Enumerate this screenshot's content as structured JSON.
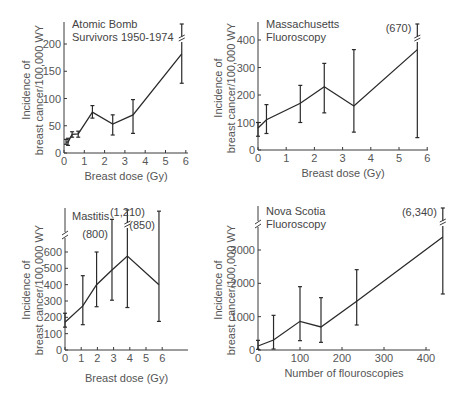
{
  "chart_data": [
    {
      "id": "atomic",
      "type": "line",
      "title": "Atomic Bomb Survivors 1950-1974",
      "title_lines": [
        "Atomic Bomb",
        "Survivors 1950-1974"
      ],
      "xlabel": "Breast dose (Gy)",
      "ylabel_lines": [
        "Incidence of",
        "breast cancer/100,000 WY"
      ],
      "xlim": [
        0,
        6
      ],
      "ylim": [
        0,
        240
      ],
      "xticks": [
        0,
        1,
        2,
        3,
        4,
        5,
        6
      ],
      "yticks": [
        0,
        50,
        100,
        150,
        200
      ],
      "x": [
        0.1,
        0.2,
        0.4,
        0.7,
        1.4,
        2.4,
        3.4,
        5.8
      ],
      "y": [
        20,
        20,
        34,
        35,
        75,
        53,
        70,
        182
      ],
      "err_low": [
        16,
        14,
        29,
        29,
        64,
        33,
        36,
        128
      ],
      "err_high": [
        25,
        27,
        39,
        40,
        87,
        70,
        98,
        238
      ],
      "grid": false,
      "legend": null
    },
    {
      "id": "massachusetts",
      "type": "line",
      "title": "Massachusetts Fluoroscopy",
      "title_lines": [
        "Massachusetts",
        "Fluoroscopy"
      ],
      "xlabel": "Breast dose (Gy)",
      "ylabel_lines": [
        "Incidence of",
        "breast cancer/100,000 WY"
      ],
      "xlim": [
        0,
        6
      ],
      "ylim": [
        0,
        450
      ],
      "xticks": [
        0,
        1,
        2,
        3,
        4,
        5,
        6
      ],
      "yticks": [
        0,
        100,
        200,
        300,
        400
      ],
      "x": [
        0,
        0.3,
        1.5,
        2.35,
        3.4,
        5.65
      ],
      "y": [
        80,
        110,
        170,
        230,
        160,
        365
      ],
      "err_low": [
        50,
        60,
        100,
        135,
        65,
        45
      ],
      "err_high": [
        100,
        165,
        235,
        315,
        365,
        670
      ],
      "annotations": [
        {
          "text": "(670)",
          "x": 5.65,
          "note": "upper error bar truncated with axis break"
        }
      ],
      "grid": false,
      "legend": null
    },
    {
      "id": "mastitis",
      "type": "line",
      "title": "Mastitis",
      "title_lines": [
        "Mastitis"
      ],
      "xlabel": "Breast dose (Gy)",
      "ylabel_lines": [
        "Incidence of",
        "breast cancer/100,000 WY"
      ],
      "xlim": [
        0,
        7.5
      ],
      "ylim": [
        0,
        700
      ],
      "xticks": [
        0,
        1,
        2,
        3,
        4,
        5,
        6
      ],
      "yticks": [
        0,
        100,
        200,
        300,
        400,
        500,
        600
      ],
      "x": [
        0,
        1.1,
        1.95,
        2.9,
        3.85,
        5.8
      ],
      "y": [
        170,
        270,
        400,
        490,
        575,
        400
      ],
      "err_low": [
        140,
        155,
        265,
        305,
        260,
        175
      ],
      "err_high": [
        225,
        455,
        600,
        800,
        1210,
        850
      ],
      "annotations": [
        {
          "text": "(800)",
          "x": 2.9
        },
        {
          "text": "(1,210)",
          "x": 3.85
        },
        {
          "text": "(850)",
          "x": 5.8
        }
      ],
      "grid": false,
      "legend": null
    },
    {
      "id": "novascotia",
      "type": "line",
      "title": "Nova Scotia Fluoroscopy",
      "title_lines": [
        "Nova Scotia",
        "Fluoroscopy"
      ],
      "xlabel": "Number of flouroscopies",
      "ylabel_lines": [
        "Incidence of",
        "breast cancer/100,000 WY"
      ],
      "xlim": [
        0,
        440
      ],
      "ylim": [
        0,
        3900
      ],
      "xticks": [
        0,
        100,
        200,
        300,
        400
      ],
      "yticks": [
        0,
        1000,
        2000,
        3000
      ],
      "x": [
        0,
        37,
        100,
        150,
        235,
        440
      ],
      "y": [
        120,
        300,
        860,
        690,
        1460,
        3390
      ],
      "err_low": [
        20,
        30,
        280,
        230,
        750,
        1680
      ],
      "err_high": [
        290,
        1040,
        1900,
        1570,
        2410,
        6340
      ],
      "annotations": [
        {
          "text": "(6,340)",
          "x": 440
        }
      ],
      "grid": false,
      "legend": null
    }
  ]
}
